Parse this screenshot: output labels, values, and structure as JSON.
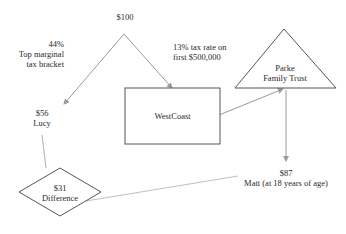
{
  "nodes": {
    "source": {
      "amount": "$100"
    },
    "tax_note_left": {
      "line1": "44%",
      "line2": "Top marginal",
      "line3": "tax bracket"
    },
    "tax_note_company": {
      "line1": "13% tax rate on",
      "line2": "first $500,000"
    },
    "company": {
      "label": "WestCoast"
    },
    "trust": {
      "line1": "Parke",
      "line2": "Family Trust"
    },
    "lucy": {
      "amount": "$56",
      "name": "Lucy"
    },
    "matt": {
      "amount": "$87",
      "name": "Matt (at 18 years of age)"
    },
    "difference": {
      "amount": "$31",
      "label": "Difference"
    }
  },
  "colors": {
    "line": "#9a9a9a",
    "shape_stroke": "#555555",
    "text": "#2a2a2a"
  }
}
